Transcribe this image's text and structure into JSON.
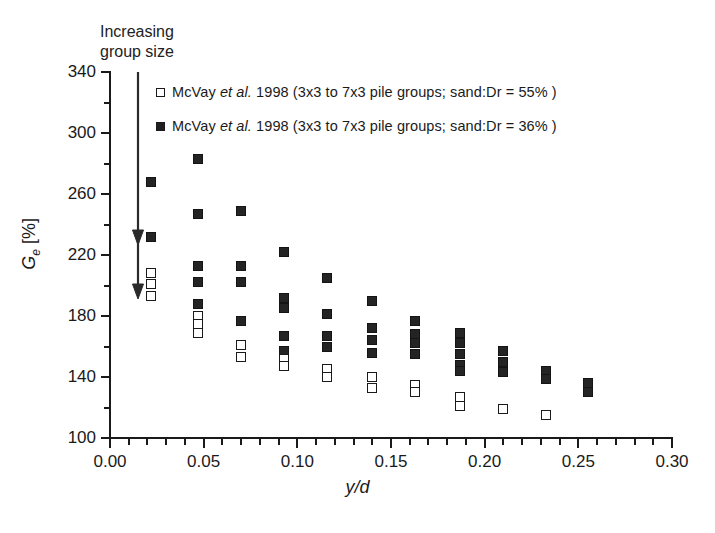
{
  "annotation": {
    "increasing_group_size": "Increasing\ngroup size",
    "line1": "Increasing",
    "line2": "group size"
  },
  "legend": {
    "position": "top-inside",
    "entries": [
      {
        "marker": "open-square",
        "label_pre": "McVay ",
        "label_italic": "et al.",
        "label_post": " 1998 (3x3 to 7x3 pile groups; sand:Dr = 55% )",
        "full": "McVay et al. 1998 (3x3 to 7x3 pile groups; sand:Dr = 55% )",
        "dr": "55%"
      },
      {
        "marker": "filled-square",
        "label_pre": "McVay ",
        "label_italic": "et al.",
        "label_post": " 1998 (3x3 to 7x3 pile groups; sand:Dr = 36% )",
        "full": "McVay et al. 1998 (3x3 to 7x3 pile groups; sand:Dr = 36% )",
        "dr": "36%"
      }
    ]
  },
  "axes": {
    "x_title": "y/d",
    "y_title_main": "G",
    "y_title_sub": "e",
    "y_title_unit": " [%]",
    "y_title_full": "Ge [%]",
    "x_ticklabels": [
      "0.00",
      "0.05",
      "0.10",
      "0.15",
      "0.20",
      "0.25",
      "0.30"
    ],
    "y_ticklabels": [
      "100",
      "140",
      "180",
      "220",
      "260",
      "300",
      "340"
    ]
  },
  "chart_data": {
    "type": "scatter",
    "title": "",
    "xlabel": "y/d",
    "ylabel": "Ge [%]",
    "xlim": [
      0.0,
      0.3
    ],
    "ylim": [
      100,
      340
    ],
    "x_major_tick": 0.05,
    "x_minor_tick": 0.01,
    "y_major_tick": 40,
    "y_minor_tick": 20,
    "grid": false,
    "legend_position": "top-inside",
    "annotations": [
      {
        "text": "Increasing group size",
        "x": 0.018,
        "y": 345,
        "arrow": true
      }
    ],
    "series": [
      {
        "name": "McVay et al. 1998 (3x3 to 7x3 pile groups; sand:Dr = 36% )",
        "marker": "filled-square",
        "color": "#242424",
        "points": [
          {
            "x": 0.022,
            "y": 268
          },
          {
            "x": 0.022,
            "y": 232
          },
          {
            "x": 0.047,
            "y": 283
          },
          {
            "x": 0.047,
            "y": 247
          },
          {
            "x": 0.047,
            "y": 213
          },
          {
            "x": 0.047,
            "y": 202
          },
          {
            "x": 0.047,
            "y": 188
          },
          {
            "x": 0.07,
            "y": 249
          },
          {
            "x": 0.07,
            "y": 213
          },
          {
            "x": 0.07,
            "y": 202
          },
          {
            "x": 0.07,
            "y": 177
          },
          {
            "x": 0.093,
            "y": 222
          },
          {
            "x": 0.093,
            "y": 192
          },
          {
            "x": 0.093,
            "y": 185
          },
          {
            "x": 0.093,
            "y": 167
          },
          {
            "x": 0.093,
            "y": 157
          },
          {
            "x": 0.116,
            "y": 205
          },
          {
            "x": 0.116,
            "y": 181
          },
          {
            "x": 0.116,
            "y": 167
          },
          {
            "x": 0.116,
            "y": 160
          },
          {
            "x": 0.14,
            "y": 190
          },
          {
            "x": 0.14,
            "y": 172
          },
          {
            "x": 0.14,
            "y": 164
          },
          {
            "x": 0.14,
            "y": 156
          },
          {
            "x": 0.163,
            "y": 177
          },
          {
            "x": 0.163,
            "y": 168
          },
          {
            "x": 0.163,
            "y": 162
          },
          {
            "x": 0.163,
            "y": 155
          },
          {
            "x": 0.187,
            "y": 169
          },
          {
            "x": 0.187,
            "y": 162
          },
          {
            "x": 0.187,
            "y": 155
          },
          {
            "x": 0.187,
            "y": 148
          },
          {
            "x": 0.187,
            "y": 144
          },
          {
            "x": 0.21,
            "y": 157
          },
          {
            "x": 0.21,
            "y": 150
          },
          {
            "x": 0.21,
            "y": 143
          },
          {
            "x": 0.233,
            "y": 144
          },
          {
            "x": 0.233,
            "y": 139
          },
          {
            "x": 0.255,
            "y": 136
          },
          {
            "x": 0.255,
            "y": 130
          }
        ]
      },
      {
        "name": "McVay et al. 1998 (3x3 to 7x3 pile groups; sand:Dr = 55% )",
        "marker": "open-square",
        "color": "#ffffff",
        "points": [
          {
            "x": 0.022,
            "y": 208
          },
          {
            "x": 0.022,
            "y": 201
          },
          {
            "x": 0.022,
            "y": 193
          },
          {
            "x": 0.047,
            "y": 180
          },
          {
            "x": 0.047,
            "y": 175
          },
          {
            "x": 0.047,
            "y": 169
          },
          {
            "x": 0.07,
            "y": 161
          },
          {
            "x": 0.07,
            "y": 153
          },
          {
            "x": 0.093,
            "y": 152
          },
          {
            "x": 0.093,
            "y": 147
          },
          {
            "x": 0.116,
            "y": 145
          },
          {
            "x": 0.116,
            "y": 140
          },
          {
            "x": 0.14,
            "y": 140
          },
          {
            "x": 0.14,
            "y": 133
          },
          {
            "x": 0.163,
            "y": 135
          },
          {
            "x": 0.163,
            "y": 130
          },
          {
            "x": 0.187,
            "y": 127
          },
          {
            "x": 0.187,
            "y": 121
          },
          {
            "x": 0.21,
            "y": 119
          },
          {
            "x": 0.233,
            "y": 115
          }
        ]
      }
    ]
  }
}
